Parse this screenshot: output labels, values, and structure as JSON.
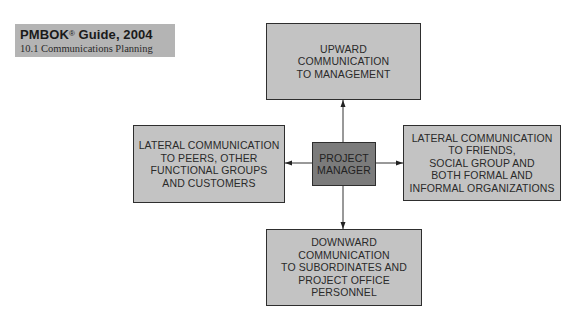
{
  "header": {
    "title": "PMBOK",
    "title_sup": "®",
    "title_rest": " Guide, 2004",
    "subtitle": "10.1 Communications Planning"
  },
  "diagram": {
    "center": {
      "label": "PROJECT\nMANAGER",
      "fill": "#7b7b7b"
    },
    "top": {
      "label": "UPWARD\nCOMMUNICATION\nTO MANAGEMENT",
      "direction": "up"
    },
    "left": {
      "label": "LATERAL COMMUNICATION\nTO PEERS, OTHER\nFUNCTIONAL GROUPS\nAND CUSTOMERS",
      "direction": "left"
    },
    "right": {
      "label": "LATERAL COMMUNICATION\nTO FRIENDS,\nSOCIAL GROUP AND\nBOTH FORMAL AND\nINFORMAL ORGANIZATIONS",
      "direction": "right"
    },
    "bottom": {
      "label": "DOWNWARD\nCOMMUNICATION\nTO SUBORDINATES AND\nPROJECT OFFICE\nPERSONNEL",
      "direction": "down"
    },
    "box_fill": "#c3c3c3",
    "border_color": "#2e2e2e"
  }
}
